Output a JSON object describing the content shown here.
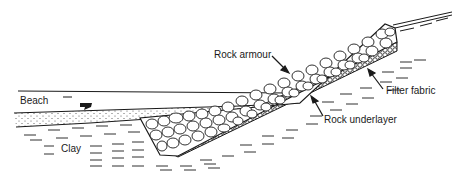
{
  "diagram": {
    "type": "revetment-cross-section",
    "labels": {
      "beach": "Beach",
      "clay": "Clay",
      "rock_armour": "Rock armour",
      "filter_fabric": "Filter fabric",
      "rock_underlayer": "Rock underlayer"
    },
    "colors": {
      "ink": "#1a1a1a",
      "background": "#ffffff"
    }
  }
}
